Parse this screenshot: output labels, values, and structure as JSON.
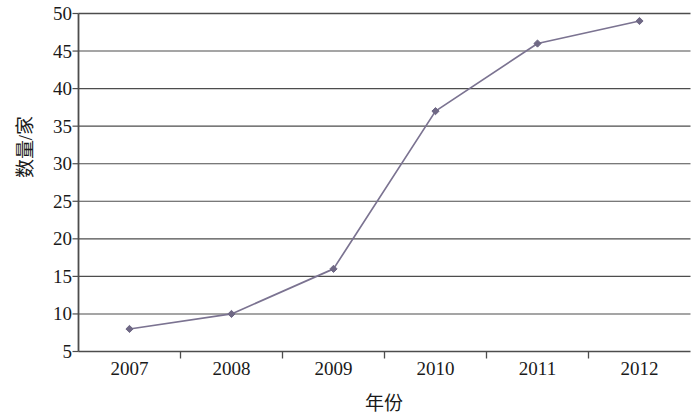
{
  "chart_data": {
    "type": "line",
    "title": "",
    "xlabel": "年份",
    "ylabel": "数量/家",
    "categories": [
      "2007",
      "2008",
      "2009",
      "2010",
      "2011",
      "2012"
    ],
    "values": [
      8,
      10,
      16,
      37,
      46,
      49
    ],
    "series": [
      {
        "name": "数量/家",
        "values": [
          8,
          10,
          16,
          37,
          46,
          49
        ]
      }
    ],
    "ylim": [
      5,
      50
    ],
    "y_ticks": [
      5,
      10,
      15,
      20,
      25,
      30,
      35,
      40,
      45,
      50
    ],
    "y_tick_labels": [
      "5",
      "10",
      "15",
      "20",
      "25",
      "30",
      "35",
      "40",
      "45",
      "50"
    ],
    "x_tick_labels": [
      "2007",
      "2008",
      "2009",
      "2010",
      "2011",
      "2012"
    ],
    "grid": "horizontal",
    "legend": "none",
    "line_color": "#7b7391",
    "marker_color": "#6f6885",
    "marker_shape": "diamond",
    "axis_color": "#4d4d4d",
    "grid_color": "#4d4d4d",
    "text_color": "#1a1a1a",
    "background_color": "#ffffff"
  }
}
